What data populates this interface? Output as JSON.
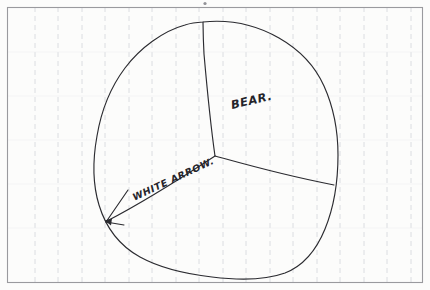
{
  "image": {
    "kind": "hand-drawn-sketch",
    "medium": "pen on faintly ruled paper",
    "width": 430,
    "height": 290
  },
  "paper": {
    "background_color": "#fcfcfb",
    "border_color": "#9a9a9e",
    "rule_color": "#d6d8dd",
    "rule_orientation": "vertical",
    "rule_style": "dashed",
    "rule_spacing_px": 23.5,
    "border_inset_px": 7
  },
  "ink": {
    "stroke_color": "#2b2b30",
    "stroke_width_px": 1.1
  },
  "annotations": [
    {
      "id": "bear",
      "text": "BEAR.",
      "role": "region-label",
      "points_to": "upper-right region",
      "rotation_deg": -13,
      "x": 231,
      "y": 104
    },
    {
      "id": "white-arrow",
      "text": "WHITE ARROW.",
      "role": "feature-label",
      "points_to": "lower-left boundary point",
      "rotation_deg": -25,
      "x": 133,
      "y": 197
    }
  ],
  "shapes": {
    "blob": {
      "name": "rounded-blob-outline",
      "description": "closed irregular rounded outline filling most of the frame",
      "extents": {
        "left": 95,
        "right": 338,
        "top": 22,
        "bottom": 278
      }
    },
    "partition": {
      "name": "three-way-y-divider",
      "center": {
        "x": 215,
        "y": 156
      },
      "branches": [
        {
          "id": "branch-up",
          "to": {
            "x": 203,
            "y": 22
          }
        },
        {
          "id": "branch-right",
          "to": {
            "x": 334,
            "y": 185
          }
        },
        {
          "id": "branch-down-left",
          "to": {
            "x": 106,
            "y": 222
          }
        }
      ]
    },
    "arrow": {
      "name": "pointer-arrow",
      "tip": {
        "x": 106,
        "y": 222
      },
      "tail": {
        "x": 215,
        "y": 156
      },
      "barbs": 2
    }
  }
}
